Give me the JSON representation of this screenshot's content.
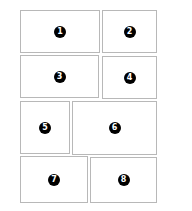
{
  "diagram": {
    "type": "panel-layout",
    "border_color": "#b8b8b8",
    "badge_color": "#000000",
    "panels": [
      {
        "label": "1",
        "x": 20,
        "y": 10,
        "w": 80,
        "h": 43
      },
      {
        "label": "2",
        "x": 102,
        "y": 10,
        "w": 55,
        "h": 43
      },
      {
        "label": "3",
        "x": 20,
        "y": 55,
        "w": 79,
        "h": 43
      },
      {
        "label": "4",
        "x": 102,
        "y": 56,
        "w": 55,
        "h": 43
      },
      {
        "label": "5",
        "x": 20,
        "y": 101,
        "w": 50,
        "h": 53
      },
      {
        "label": "6",
        "x": 72,
        "y": 101,
        "w": 85,
        "h": 54
      },
      {
        "label": "7",
        "x": 20,
        "y": 156,
        "w": 68,
        "h": 47
      },
      {
        "label": "8",
        "x": 90,
        "y": 157,
        "w": 67,
        "h": 46
      }
    ]
  }
}
